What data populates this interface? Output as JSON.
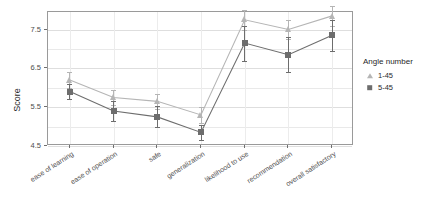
{
  "chart_data": {
    "type": "line",
    "title": "",
    "xlabel": "",
    "ylabel": "Score",
    "ylim": [
      4.5,
      7.95
    ],
    "yticks": [
      "4.5",
      "5.5",
      "6.5",
      "7.5"
    ],
    "ytick_values": [
      4.5,
      5.5,
      6.5,
      7.5
    ],
    "grid": true,
    "legend_position": "right",
    "legend_title": "Angle number",
    "categories": [
      "ease of learning",
      "ease of operation",
      "safe",
      "generalization",
      "likelihood to use",
      "recommendation",
      "overall satisfactory"
    ],
    "series": [
      {
        "name": "1-45",
        "marker": "triangle",
        "color": "#b5b5b5",
        "values": [
          6.2,
          5.75,
          5.65,
          5.3,
          7.75,
          7.5,
          7.85
        ],
        "err_low": [
          6.0,
          5.55,
          5.45,
          5.1,
          7.5,
          7.25,
          7.6
        ],
        "err_high": [
          6.4,
          5.95,
          5.85,
          5.5,
          8.0,
          7.75,
          8.1
        ]
      },
      {
        "name": "5-45",
        "marker": "square",
        "color": "#6d6d6d",
        "values": [
          5.9,
          5.4,
          5.25,
          4.85,
          7.15,
          6.85,
          7.35
        ],
        "err_low": [
          5.7,
          5.15,
          4.98,
          4.65,
          6.7,
          6.4,
          6.95
        ],
        "err_high": [
          6.1,
          5.65,
          5.52,
          5.05,
          7.6,
          7.3,
          7.75
        ]
      }
    ]
  },
  "legend": {
    "title": "Angle number",
    "items": [
      {
        "label": "1-45"
      },
      {
        "label": "5-45"
      }
    ]
  },
  "axes": {
    "y_label": "Score"
  }
}
